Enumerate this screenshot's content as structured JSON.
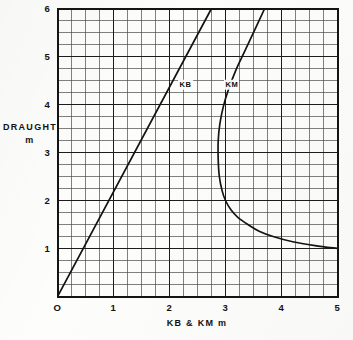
{
  "chart_data": {
    "type": "line",
    "title": "",
    "xlabel": "KB & KM   m",
    "ylabel_line1": "DRAUGHT",
    "ylabel_line2": "m",
    "xlim": [
      0,
      5
    ],
    "ylim": [
      0,
      6
    ],
    "x_major_step": 1,
    "y_major_step": 1,
    "x_minor_step": 0.25,
    "y_minor_step": 0.25,
    "grid": true,
    "grid_style": "engineering graph paper, minor lines every 0.25 unit, heavier major lines every 1 unit",
    "legend_position": "inline labels on curves",
    "origin_label": "O",
    "x_tick_labels": [
      "O",
      "1",
      "2",
      "3",
      "4",
      "5"
    ],
    "x_tick_values": [
      0,
      1,
      2,
      3,
      4,
      5
    ],
    "y_tick_labels": [
      "1",
      "2",
      "3",
      "4",
      "5",
      "6"
    ],
    "y_tick_values": [
      1,
      2,
      3,
      4,
      5,
      6
    ],
    "series": [
      {
        "name": "KB",
        "label": "KB",
        "label_x": 2.18,
        "label_y": 4.36,
        "description": "Straight line through the origin; KB is directly proportional to draught",
        "x": [
          0.0,
          0.25,
          0.5,
          0.75,
          1.0,
          1.25,
          1.5,
          1.75,
          2.0,
          2.25,
          2.5,
          2.75
        ],
        "y": [
          0.0,
          0.545,
          1.09,
          1.635,
          2.18,
          2.725,
          3.27,
          3.815,
          4.36,
          4.905,
          5.45,
          6.0
        ],
        "slope_y_per_x": 2.18
      },
      {
        "name": "KM",
        "label": "KM",
        "label_x": 3.0,
        "label_y": 4.36,
        "description": "Hyperbola-like curve; KM falls to a minimum near 2.87 m at about 3.3 m draught then rises steeply for shallow draughts and increases slowly for deep draughts",
        "x": [
          5.0,
          4.6,
          4.2,
          3.85,
          3.6,
          3.4,
          3.22,
          3.1,
          3.0,
          2.94,
          2.89,
          2.87,
          2.87,
          2.9,
          2.96,
          3.05,
          3.18,
          3.34,
          3.52,
          3.7
        ],
        "y": [
          1.0,
          1.06,
          1.14,
          1.25,
          1.36,
          1.5,
          1.65,
          1.8,
          2.0,
          2.2,
          2.5,
          2.85,
          3.25,
          3.6,
          3.95,
          4.3,
          4.7,
          5.1,
          5.55,
          6.0
        ],
        "min_km": 2.87,
        "min_km_at_draught": 3.3
      }
    ]
  },
  "colors": {
    "ink": "#141414",
    "grid_minor": "#4a4a4a",
    "grid_major": "#1c1c1c",
    "paper": "#fdfdfb"
  }
}
